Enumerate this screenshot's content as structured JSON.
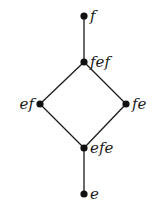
{
  "diagram": {
    "type": "hasse-diagram",
    "nodes": [
      {
        "id": "f",
        "label": "f",
        "x": 84,
        "y": 16,
        "label_side": "right"
      },
      {
        "id": "fef",
        "label": "fef",
        "x": 84,
        "y": 62,
        "label_side": "right"
      },
      {
        "id": "ef",
        "label": "ef",
        "x": 40,
        "y": 104,
        "label_side": "left"
      },
      {
        "id": "fe",
        "label": "fe",
        "x": 126,
        "y": 104,
        "label_side": "right"
      },
      {
        "id": "efe",
        "label": "efe",
        "x": 84,
        "y": 148,
        "label_side": "right"
      },
      {
        "id": "e",
        "label": "e",
        "x": 84,
        "y": 194,
        "label_side": "right"
      }
    ],
    "edges": [
      [
        "f",
        "fef"
      ],
      [
        "fef",
        "ef"
      ],
      [
        "fef",
        "fe"
      ],
      [
        "ef",
        "efe"
      ],
      [
        "fe",
        "efe"
      ],
      [
        "efe",
        "e"
      ]
    ],
    "colors": {
      "line": "#1a1a1a",
      "node": "#111111",
      "background": "#ffffff"
    }
  }
}
